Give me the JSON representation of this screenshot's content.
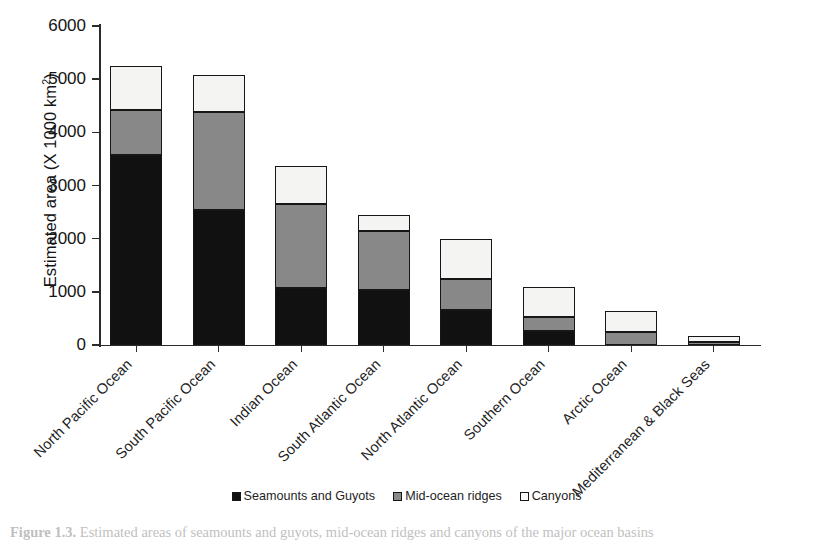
{
  "chart_data": {
    "type": "bar",
    "subtype": "stacked-vertical-bar",
    "title": "",
    "xlabel": "",
    "ylabel": "Estimated area (X 1000 km2)",
    "ylabel_display": "Estimated area (X 1000 km",
    "ylabel_superscript": "2",
    "ylabel_suffix": ")",
    "ylim": [
      0,
      6000
    ],
    "ytick_step": 1000,
    "yticks": [
      0,
      1000,
      2000,
      3000,
      4000,
      5000,
      6000
    ],
    "ytick_labels": [
      "0",
      "1000",
      "2000",
      "3000",
      "4000",
      "5000",
      "6000"
    ],
    "grid": false,
    "legend_position": "bottom-center",
    "categories": [
      "North Pacific Ocean",
      "South Pacific Ocean",
      "Indian Ocean",
      "South Atlantic Ocean",
      "North Atlantic Ocean",
      "Southern Ocean",
      "Arctic Ocean",
      "Mediterranean & Black Seas"
    ],
    "series": [
      {
        "name": "Seamounts and Guyots",
        "color": "#111111",
        "values": [
          3570,
          2540,
          1070,
          1030,
          650,
          270,
          0,
          0
        ]
      },
      {
        "name": "Mid-ocean ridges",
        "color": "#888888",
        "values": [
          850,
          1850,
          1580,
          1110,
          600,
          260,
          250,
          50
        ]
      },
      {
        "name": "Canyons",
        "color": "#f4f4f2",
        "values": [
          830,
          690,
          710,
          300,
          750,
          570,
          390,
          120
        ]
      }
    ],
    "totals": [
      5250,
      5080,
      3360,
      2440,
      2000,
      1100,
      640,
      170
    ]
  },
  "legend": {
    "items": [
      {
        "label": "Seamounts and Guyots",
        "swatch": "black-square-icon"
      },
      {
        "label": "Mid-ocean ridges",
        "swatch": "gray-square-icon"
      },
      {
        "label": "Canyons",
        "swatch": "white-square-icon"
      }
    ]
  },
  "caption": {
    "figure_number": "Figure 1.3.",
    "text": "Estimated areas of seamounts and guyots, mid-ocean ridges and canyons of the major ocean basins"
  }
}
